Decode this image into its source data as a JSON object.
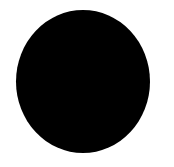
{
  "canvas": {
    "width": 174,
    "height": 167,
    "background_color": "#ffffff"
  },
  "shape": {
    "type": "ellipse",
    "fill_color": "#000000",
    "left": 16,
    "top": 10,
    "width": 134,
    "height": 143
  }
}
